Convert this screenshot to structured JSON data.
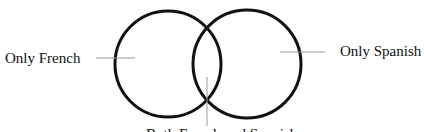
{
  "diagram": {
    "type": "venn",
    "labels": {
      "only_french": "Only French",
      "only_spanish": "Only Spanish",
      "both": "Both French and Spanish"
    },
    "colors": {
      "circle_stroke": "#111111",
      "leader_line": "#999999",
      "background": "#ffffff"
    }
  }
}
